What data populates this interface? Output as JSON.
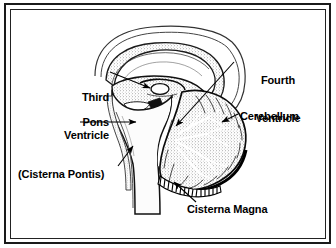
{
  "figure": {
    "kind": "anatomical-diagram",
    "background_color": "#ffffff",
    "ink_color": "#000000",
    "frame": {
      "style": "double-rule rectangle",
      "outer_color": "#1a1a1a",
      "inner_color": "#222222"
    }
  },
  "labels": {
    "third_ventricle": {
      "line1": "Third",
      "line2": "Ventricle",
      "text": "Third Ventricle",
      "align": "right",
      "leader": "horizontal line to arrowhead pointing right at third ventricle cavity"
    },
    "pons": {
      "text": "Pons",
      "align": "right",
      "leader": "horizontal line to arrowhead pointing right at pons"
    },
    "cisterna_pontis": {
      "text": "(Cisterna Pontis)",
      "align": "left",
      "leader": "diagonal line up-right to arrowhead at prepontine cistern"
    },
    "fourth_ventricle": {
      "line1": "Fourth",
      "line2": "Ventricle",
      "text": "Fourth Ventricle",
      "align": "center",
      "leader": "long diagonal line down-left to arrowhead at fourth ventricle"
    },
    "cerebellum": {
      "text": "Cerebellum",
      "align": "left",
      "leader": "short diagonal line down-left to arrowhead at cerebellar cortex"
    },
    "cisterna_magna": {
      "text": "Cisterna Magna",
      "align": "left",
      "leader": "diagonal line up-left to arrowhead at cisterna magna"
    }
  },
  "structures": [
    {
      "name": "corpus-callosum",
      "note": "arching outline over the diencephalon"
    },
    {
      "name": "third-ventricle",
      "note": "small pale cavity in midline diencephalon"
    },
    {
      "name": "pons",
      "note": "bulging brainstem anterior to fourth ventricle"
    },
    {
      "name": "cerebellum",
      "note": "stippled mass with arbor vitae branching pattern"
    },
    {
      "name": "fourth-ventricle",
      "note": "thin cavity between pons and cerebellum"
    },
    {
      "name": "cisterna-magna",
      "note": "hatched subarachnoid space below cerebellum"
    },
    {
      "name": "cisterna-pontis",
      "note": "narrow space anterior to pons"
    },
    {
      "name": "medulla-spinal-cord",
      "note": "column descending from pons"
    }
  ]
}
